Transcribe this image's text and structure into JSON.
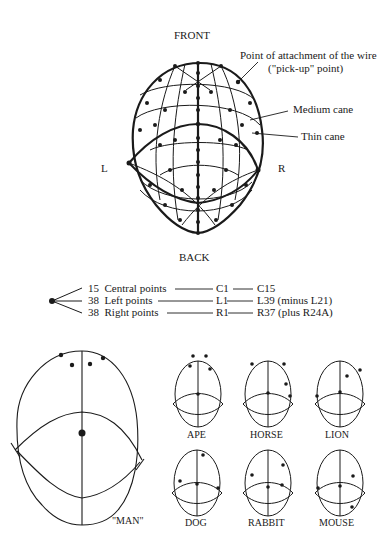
{
  "main_diagram": {
    "front_label": "FRONT",
    "back_label": "BACK",
    "left_label": "L",
    "right_label": "R",
    "callouts": {
      "attachment_line1": "Point of attachment of the wire",
      "attachment_line2": "(\"pick-up\" point)",
      "medium_cane": "Medium cane",
      "thin_cane": "Thin cane"
    }
  },
  "legend": {
    "rows": [
      {
        "count": "15",
        "label": "Central points",
        "from": "C1",
        "to": "C15",
        "note": ""
      },
      {
        "count": "38",
        "label": "Left points",
        "from": "L1",
        "to": "L39",
        "note": "(minus L21)"
      },
      {
        "count": "38",
        "label": "Right points",
        "from": "R1",
        "to": "R37",
        "note": "(plus R24A)"
      }
    ]
  },
  "heads": {
    "man": "\"MAN\"",
    "animals": [
      "APE",
      "HORSE",
      "LION",
      "DOG",
      "RABBIT",
      "MOUSE"
    ]
  },
  "colors": {
    "ink": "#1a1a1a",
    "background": "#ffffff"
  }
}
